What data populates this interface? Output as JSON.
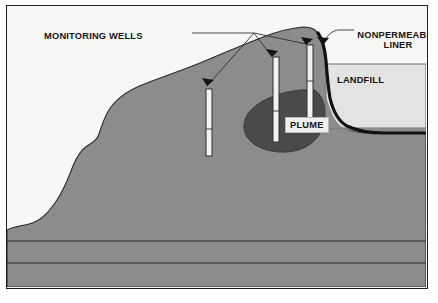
{
  "figure": {
    "type": "cross-section-diagram",
    "caption": ""
  },
  "labels": {
    "monitoring_wells": "MONITORING WELLS",
    "nonpermeable_liner": "NONPERMEABLE LINER",
    "landfill": "LANDFILL",
    "plume": "PLUME"
  },
  "colors": {
    "frame_border": "#202020",
    "sky": "#f7f7f5",
    "ground": "#8c8c8c",
    "ground_outline": "#2a2a2a",
    "plume": "#4a4a4a",
    "landfill_fill": "#e3e3e1",
    "landfill_border": "#6e6e6e",
    "liner": "#121212",
    "well_fill": "#f2f2f0",
    "well_outline": "#303030",
    "leader_line": "#2a2a2a",
    "label_text": "#141414"
  },
  "elements": {
    "wells": [
      {
        "name": "monitoring-well-left",
        "x": 205,
        "top": 88,
        "bottom": 155,
        "width": 6,
        "screen_band_y": 128
      },
      {
        "name": "monitoring-well-middle",
        "x": 272,
        "top": 56,
        "bottom": 141,
        "width": 6,
        "screen_band_y": 110
      },
      {
        "name": "monitoring-well-right",
        "x": 306,
        "top": 44,
        "bottom": 125,
        "width": 6,
        "screen_band_y": 80
      }
    ],
    "leader_junction": {
      "x": 253,
      "y": 32
    },
    "arrow_targets": [
      {
        "name": "arrow-to-left-well",
        "x": 208,
        "y": 86
      },
      {
        "name": "arrow-to-middle-well",
        "x": 272,
        "y": 57
      },
      {
        "name": "arrow-to-right-well",
        "x": 306,
        "y": 44
      }
    ],
    "liner_arrow": {
      "name": "arrow-to-liner",
      "x": 322,
      "y": 45
    },
    "landfill_box": {
      "x": 325,
      "y": 63,
      "width": 103,
      "height": 64
    },
    "strata_lines_y": [
      240,
      262
    ]
  }
}
